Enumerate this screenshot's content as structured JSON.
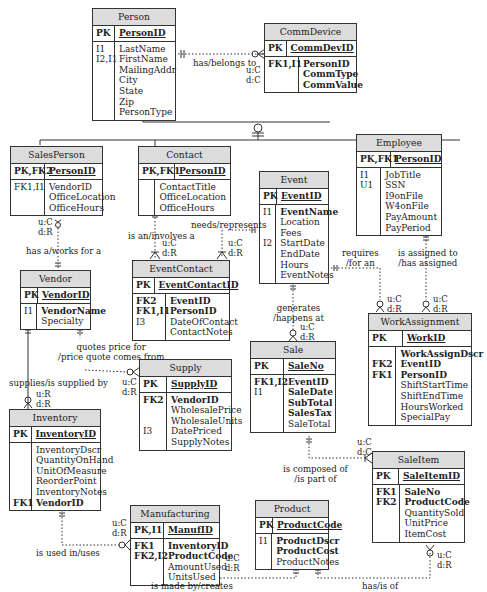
{
  "diagram": {
    "type": "ER diagram (IDEF1X-style)",
    "entities": [
      {
        "id": "person",
        "title": "Person",
        "pk_key": "PK",
        "pk_attr": "PersonID",
        "keys": [
          "I1",
          "I2,I1",
          "",
          "",
          "",
          "",
          ""
        ],
        "attrs": [
          {
            "name": "LastName",
            "bold": false
          },
          {
            "name": "FirstName",
            "bold": false
          },
          {
            "name": "MailingAddr",
            "bold": false
          },
          {
            "name": "City",
            "bold": false
          },
          {
            "name": "State",
            "bold": false
          },
          {
            "name": "Zip",
            "bold": false
          },
          {
            "name": "PersonType",
            "bold": false
          }
        ]
      },
      {
        "id": "commdevice",
        "title": "CommDevice",
        "pk_key": "PK",
        "pk_attr": "CommDevID",
        "keys": [
          "FK1,I1",
          "",
          ""
        ],
        "attrs": [
          {
            "name": "PersonID",
            "bold": true
          },
          {
            "name": "CommType",
            "bold": true
          },
          {
            "name": "CommValue",
            "bold": true
          }
        ]
      },
      {
        "id": "salesperson",
        "title": "SalesPerson",
        "pk_key": "PK,FK2",
        "pk_attr": "PersonID",
        "keys": [
          "FK1,I1",
          "",
          ""
        ],
        "attrs": [
          {
            "name": "VendorID",
            "bold": false
          },
          {
            "name": "OfficeLocation",
            "bold": false
          },
          {
            "name": "OfficeHours",
            "bold": false
          }
        ]
      },
      {
        "id": "contact",
        "title": "Contact",
        "pk_key": "PK,FK1",
        "pk_attr": "PersonID",
        "keys": [
          "",
          "",
          ""
        ],
        "attrs": [
          {
            "name": "ContactTitle",
            "bold": false
          },
          {
            "name": "OfficeLocation",
            "bold": false
          },
          {
            "name": "OfficeHours",
            "bold": false
          }
        ]
      },
      {
        "id": "employee",
        "title": "Employee",
        "pk_key": "PK,FK1",
        "pk_attr": "PersonID",
        "keys": [
          "I1",
          "U1",
          "",
          "",
          "",
          ""
        ],
        "attrs": [
          {
            "name": "JobTitle",
            "bold": false
          },
          {
            "name": "SSN",
            "bold": false
          },
          {
            "name": "I9onFile",
            "bold": false
          },
          {
            "name": "W4onFile",
            "bold": false
          },
          {
            "name": "PayAmount",
            "bold": false
          },
          {
            "name": "PayPeriod",
            "bold": false
          }
        ]
      },
      {
        "id": "event",
        "title": "Event",
        "pk_key": "PK",
        "pk_attr": "EventID",
        "keys": [
          "I1",
          "",
          "",
          "I2",
          "",
          "",
          ""
        ],
        "attrs": [
          {
            "name": "EventName",
            "bold": true
          },
          {
            "name": "Location",
            "bold": false
          },
          {
            "name": "Fees",
            "bold": false
          },
          {
            "name": "StartDate",
            "bold": false
          },
          {
            "name": "EndDate",
            "bold": false
          },
          {
            "name": "Hours",
            "bold": false
          },
          {
            "name": "EventNotes",
            "bold": false
          }
        ]
      },
      {
        "id": "vendor",
        "title": "Vendor",
        "pk_key": "PK",
        "pk_attr": "VendorID",
        "keys": [
          "I1",
          ""
        ],
        "attrs": [
          {
            "name": "VendorName",
            "bold": true
          },
          {
            "name": "Specialty",
            "bold": false
          }
        ]
      },
      {
        "id": "eventcontact",
        "title": "EventContact",
        "pk_key": "PK",
        "pk_attr": "EventContactID",
        "keys": [
          "FK2",
          "FK1,I1",
          "I3",
          ""
        ],
        "attrs": [
          {
            "name": "EventID",
            "bold": true
          },
          {
            "name": "PersonID",
            "bold": true
          },
          {
            "name": "DateOfContact",
            "bold": false
          },
          {
            "name": "ContactNotes",
            "bold": false
          }
        ]
      },
      {
        "id": "workassignment",
        "title": "WorkAssignment",
        "pk_key": "PK",
        "pk_attr": "WorkID",
        "keys": [
          "",
          "FK2",
          "FK1",
          "",
          "",
          "",
          ""
        ],
        "attrs": [
          {
            "name": "WorkAssignDscr",
            "bold": true
          },
          {
            "name": "EventID",
            "bold": true
          },
          {
            "name": "PersonID",
            "bold": true
          },
          {
            "name": "ShiftStartTime",
            "bold": false
          },
          {
            "name": "ShiftEndTime",
            "bold": false
          },
          {
            "name": "HoursWorked",
            "bold": false
          },
          {
            "name": "SpecialPay",
            "bold": false
          }
        ]
      },
      {
        "id": "supply",
        "title": "Supply",
        "pk_key": "PK",
        "pk_attr": "SupplyID",
        "keys": [
          "FK2",
          "",
          "",
          "I3",
          ""
        ],
        "attrs": [
          {
            "name": "VendorID",
            "bold": true
          },
          {
            "name": "WholesalePrice",
            "bold": false
          },
          {
            "name": "WholesaleUnits",
            "bold": false
          },
          {
            "name": "DatePriced",
            "bold": false
          },
          {
            "name": "SupplyNotes",
            "bold": false
          }
        ]
      },
      {
        "id": "sale",
        "title": "Sale",
        "pk_key": "PK",
        "pk_attr": "SaleNo",
        "keys": [
          "FK1,I2",
          "I1",
          "",
          "",
          ""
        ],
        "attrs": [
          {
            "name": "EventID",
            "bold": true
          },
          {
            "name": "SaleDate",
            "bold": true
          },
          {
            "name": "SubTotal",
            "bold": true
          },
          {
            "name": "SalesTax",
            "bold": true
          },
          {
            "name": "SaleTotal",
            "bold": false
          }
        ]
      },
      {
        "id": "inventory",
        "title": "Inventory",
        "pk_key": "PK",
        "pk_attr": "InventoryID",
        "keys": [
          "",
          "",
          "",
          "",
          "",
          "FK1"
        ],
        "attrs": [
          {
            "name": "InventoryDscr",
            "bold": false
          },
          {
            "name": "QuantityOnHand",
            "bold": false
          },
          {
            "name": "UnitOfMeasure",
            "bold": false
          },
          {
            "name": "ReorderPoint",
            "bold": false
          },
          {
            "name": "InventoryNotes",
            "bold": false
          },
          {
            "name": "VendorID",
            "bold": true
          }
        ]
      },
      {
        "id": "saleitem",
        "title": "SaleItem",
        "pk_key": "PK",
        "pk_attr": "SaleItemID",
        "keys": [
          "FK1",
          "FK2",
          "",
          "",
          ""
        ],
        "attrs": [
          {
            "name": "SaleNo",
            "bold": true
          },
          {
            "name": "ProductCode",
            "bold": true
          },
          {
            "name": "QuantitySold",
            "bold": false
          },
          {
            "name": "UnitPrice",
            "bold": false
          },
          {
            "name": "ItemCost",
            "bold": false
          }
        ]
      },
      {
        "id": "manufacturing",
        "title": "Manufacturing",
        "pk_key": "PK,I1",
        "pk_attr": "ManufID",
        "keys": [
          "FK1",
          "FK2,I2",
          "",
          ""
        ],
        "attrs": [
          {
            "name": "InventoryID",
            "bold": true
          },
          {
            "name": "ProductCode",
            "bold": true
          },
          {
            "name": "AmountUsed",
            "bold": false
          },
          {
            "name": "UnitsUsed",
            "bold": false
          }
        ]
      },
      {
        "id": "product",
        "title": "Product",
        "pk_key": "PK",
        "pk_attr": "ProductCode",
        "keys": [
          "I1",
          "",
          ""
        ],
        "attrs": [
          {
            "name": "ProductDscr",
            "bold": true
          },
          {
            "name": "ProductCost",
            "bold": true
          },
          {
            "name": "ProductNotes",
            "bold": false
          }
        ]
      }
    ],
    "relationships": [
      {
        "from": "Person",
        "to": "CommDevice",
        "label": "has/belongs to",
        "card": "u:C d:C"
      },
      {
        "from": "Person",
        "to": "SalesPerson / Contact / Employee",
        "label": "subtype (category)"
      },
      {
        "from": "Vendor",
        "to": "SalesPerson",
        "label": "has a/works for a",
        "card": "u:C d:R"
      },
      {
        "from": "Contact",
        "to": "EventContact",
        "label": "is an/involves a",
        "card": "u:C d:R"
      },
      {
        "from": "Event",
        "to": "EventContact",
        "label": "needs/represents",
        "card": "u:C d:R"
      },
      {
        "from": "Event",
        "to": "WorkAssignment",
        "label": "requires /for an",
        "card": "u:C d:R"
      },
      {
        "from": "Employee",
        "to": "WorkAssignment",
        "label": "is assigned to /has assigned",
        "card": "u:C d:R"
      },
      {
        "from": "Event",
        "to": "Sale",
        "label": "generates /happens at",
        "card": "u:C d:R"
      },
      {
        "from": "Vendor",
        "to": "Supply",
        "label": "quotes price for /price quote comes from",
        "card": "u:C d:R"
      },
      {
        "from": "Vendor",
        "to": "Inventory",
        "label": "supplies/is supplied by",
        "card": "u:R d:R"
      },
      {
        "from": "Sale",
        "to": "SaleItem",
        "label": "is composed of /is part of",
        "card": "u:C d:C"
      },
      {
        "from": "Inventory",
        "to": "Manufacturing",
        "label": "is used in/uses",
        "card": "u:C d:R"
      },
      {
        "from": "Product",
        "to": "Manufacturing",
        "label": "is made by/creates",
        "card": "u:C d:R"
      },
      {
        "from": "Product",
        "to": "SaleItem",
        "label": "has/is of",
        "card": "u:C d:R"
      }
    ]
  },
  "labels": {
    "has_belongs_to": "has/belongs to",
    "has_a_works_for": "has a/works for a",
    "is_an_involves": "is an/involves a",
    "needs_represents": "needs/represents",
    "requires_1": "requires",
    "requires_2": "/for an",
    "assigned_1": "is assigned to",
    "assigned_2": "/has assigned",
    "generates_1": "generates",
    "generates_2": "/happens at",
    "quotes_1": "quotes price for",
    "quotes_2": "/price quote comes from",
    "supplies": "supplies/is supplied by",
    "composed_1": "is composed of",
    "composed_2": "/is part of",
    "used_in": "is used in/uses",
    "made_by": "is made by/creates",
    "has_is_of": "has/is of"
  },
  "cards": {
    "uC": "u:C",
    "dC": "d:C",
    "dR": "d:R",
    "uR": "u:R"
  }
}
